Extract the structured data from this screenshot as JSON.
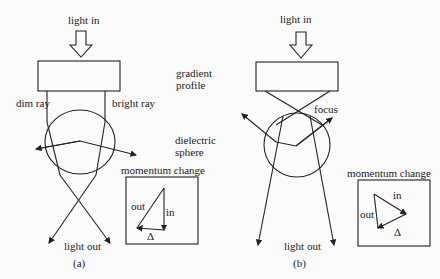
{
  "panel_a": {
    "light_in": "light in",
    "gradient_line1": "gradient",
    "gradient_line2": "profile",
    "dim_ray": "dim ray",
    "bright_ray": "bright ray",
    "sphere_line1": "dielectric",
    "sphere_line2": "sphere",
    "momentum_title": "momentum change",
    "vec_out": "out",
    "vec_in": "in",
    "vec_delta": "Δ",
    "light_out": "light out",
    "caption": "(a)"
  },
  "panel_b": {
    "light_in": "light in",
    "focus": "focus",
    "momentum_title": "momentum change",
    "vec_out": "out",
    "vec_in": "in",
    "vec_delta": "Δ",
    "light_out": "light out",
    "caption": "(b)"
  }
}
